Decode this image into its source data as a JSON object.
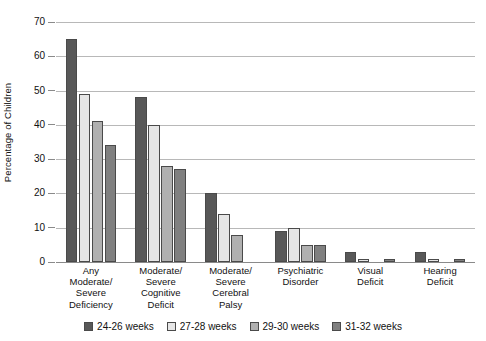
{
  "chart_data": {
    "type": "bar",
    "title": "",
    "subtitle": "",
    "xlabel": "",
    "ylabel": "Percentage of Children",
    "ylim": [
      0,
      70
    ],
    "ytick_step": 10,
    "yticks": [
      0,
      10,
      20,
      30,
      40,
      50,
      60,
      70
    ],
    "ytick_labels": [
      "0",
      "10",
      "20",
      "30",
      "40",
      "50",
      "60",
      "70"
    ],
    "grid": true,
    "grid_axis": "y",
    "legend_position": "bottom-center",
    "categories": [
      "Any\nModerate/\nSevere\nDeficiency",
      "Moderate/\nSevere\nCognitive\nDeficit",
      "Moderate/\nSevere\nCerebral\nPalsy",
      "Psychiatric\nDisorder",
      "Visual\nDeficit",
      "Hearing\nDeficit"
    ],
    "series": [
      {
        "name": "24-26 weeks",
        "color": "#585858",
        "values": [
          65,
          48,
          20,
          9,
          3,
          3
        ]
      },
      {
        "name": "27-28 weeks",
        "color": "#e6e6e6",
        "values": [
          49,
          40,
          14,
          10,
          1,
          1
        ]
      },
      {
        "name": "29-30 weeks",
        "color": "#b0b0b0",
        "values": [
          41,
          28,
          8,
          5,
          0,
          0
        ]
      },
      {
        "name": "31-32 weeks",
        "color": "#808080",
        "values": [
          34,
          27,
          0,
          5,
          1,
          1
        ]
      }
    ]
  },
  "axis": {
    "y_title": "Percentage of Children"
  },
  "category_labels": [
    {
      "lines": [
        "Any",
        "Moderate/",
        "Severe",
        "Deficiency"
      ]
    },
    {
      "lines": [
        "Moderate/",
        "Severe",
        "Cognitive",
        "Deficit"
      ]
    },
    {
      "lines": [
        "Moderate/",
        "Severe",
        "Cerebral",
        "Palsy"
      ]
    },
    {
      "lines": [
        "Psychiatric",
        "Disorder"
      ]
    },
    {
      "lines": [
        "Visual",
        "Deficit"
      ]
    },
    {
      "lines": [
        "Hearing",
        "Deficit"
      ]
    }
  ],
  "legend": {
    "items": [
      {
        "label": "24-26 weeks",
        "color": "#585858"
      },
      {
        "label": "27-28 weeks",
        "color": "#e6e6e6"
      },
      {
        "label": "29-30 weeks",
        "color": "#b0b0b0"
      },
      {
        "label": "31-32 weeks",
        "color": "#808080"
      }
    ]
  }
}
